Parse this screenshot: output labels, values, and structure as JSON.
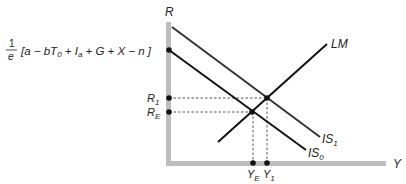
{
  "diagram": {
    "type": "IS-LM",
    "axes": {
      "y_label": "R",
      "x_label": "Y",
      "color": "#bdbdbd"
    },
    "intercept_label": {
      "fraction_numerator": "1",
      "fraction_denominator": "e",
      "bracket_expression": "[a − bT0 + Ia + G + X − n]",
      "parts": {
        "open": "[a − b",
        "T": "T",
        "T_sub": "0",
        "mid1": " + ",
        "I": "I",
        "I_sub": "a",
        "rest": " + G + X − n ]"
      }
    },
    "curves": [
      {
        "name": "IS0",
        "label_main": "IS",
        "label_sub": "0",
        "color": "#111111",
        "from": [
          169,
          50
        ],
        "to": [
          306,
          150
        ]
      },
      {
        "name": "IS1",
        "label_main": "IS",
        "label_sub": "1",
        "color": "#333333",
        "from": [
          172,
          27
        ],
        "to": [
          320,
          137
        ]
      },
      {
        "name": "LM",
        "label_main": "LM",
        "label_sub": "",
        "color": "#111111",
        "from": [
          218,
          142
        ],
        "to": [
          327,
          44
        ]
      }
    ],
    "equilibria": [
      {
        "name": "E",
        "r_label_main": "R",
        "r_label_sub": "E",
        "y_label_main": "Y",
        "y_label_sub": "E",
        "point": [
          252,
          112
        ]
      },
      {
        "name": "1",
        "r_label_main": "R",
        "r_label_sub": "1",
        "y_label_main": "Y",
        "y_label_sub": "1",
        "point": [
          267,
          98
        ]
      }
    ]
  }
}
